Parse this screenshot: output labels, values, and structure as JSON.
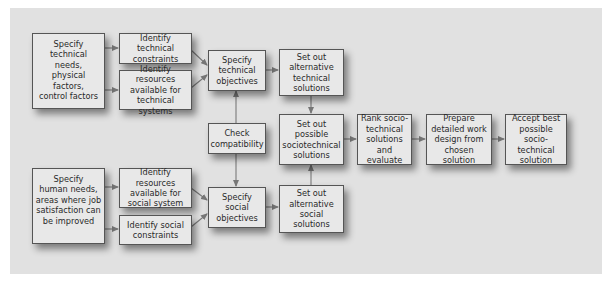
{
  "diagram": {
    "colors": {
      "background": "#ffffff",
      "panel": "#e1e1e1",
      "box_fill": "#e8e8e8",
      "box_border": "#555555",
      "arrow": "#777777",
      "text": "#2a2a2a"
    },
    "nodes": {
      "specify_technical_needs": "Specify\ntechnical needs,\nphysical factors,\ncontrol factors",
      "identify_technical_constraints": "Identify technical\nconstraints",
      "identify_resources_technical": "Identify resources\navailable for\ntechnical systems",
      "specify_technical_objectives": "Specify\ntechnical\nobjectives",
      "set_out_alternative_technical": "Set out\nalternative\ntechnical\nsolutions",
      "check_compatibility": "Check\ncompatibility",
      "set_out_possible_sociotechnical": "Set out\npossible\nsociotechnical\nsolutions",
      "rank_sociotechnical": "Rank socio-\ntechnical\nsolutions\nand evaluate",
      "prepare_work_design": "Prepare\ndetailed work\ndesign from\nchosen solution",
      "accept_best": "Accept best\npossible socio-\ntechnical\nsolution",
      "specify_human_needs": "Specify\nhuman needs,\nareas where job\nsatisfaction can\nbe improved",
      "identify_resources_social": "Identify resources\navailable for\nsocial system",
      "identify_social_constraints": "Identify social\nconstraints",
      "specify_social_objectives": "Specify\nsocial\nobjectives",
      "set_out_alternative_social": "Set out\nalternative\nsocial\nsolutions"
    },
    "edges": [
      [
        "specify_technical_needs",
        "identify_technical_constraints"
      ],
      [
        "specify_technical_needs",
        "identify_resources_technical"
      ],
      [
        "identify_technical_constraints",
        "specify_technical_objectives"
      ],
      [
        "identify_resources_technical",
        "specify_technical_objectives"
      ],
      [
        "check_compatibility",
        "specify_technical_objectives"
      ],
      [
        "check_compatibility",
        "specify_social_objectives"
      ],
      [
        "specify_technical_objectives",
        "set_out_alternative_technical"
      ],
      [
        "set_out_alternative_technical",
        "set_out_possible_sociotechnical"
      ],
      [
        "set_out_alternative_social",
        "set_out_possible_sociotechnical"
      ],
      [
        "set_out_possible_sociotechnical",
        "rank_sociotechnical"
      ],
      [
        "rank_sociotechnical",
        "prepare_work_design"
      ],
      [
        "prepare_work_design",
        "accept_best"
      ],
      [
        "specify_human_needs",
        "identify_resources_social"
      ],
      [
        "specify_human_needs",
        "identify_social_constraints"
      ],
      [
        "identify_resources_social",
        "specify_social_objectives"
      ],
      [
        "identify_social_constraints",
        "specify_social_objectives"
      ],
      [
        "specify_social_objectives",
        "set_out_alternative_social"
      ]
    ]
  }
}
